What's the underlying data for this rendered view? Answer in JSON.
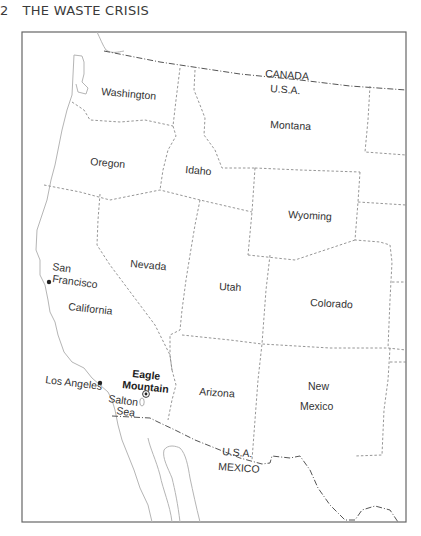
{
  "header": {
    "page_number": "2",
    "title": "THE WASTE CRISIS"
  },
  "map": {
    "countries": {
      "canada": "CANADA",
      "usa_north": "U.S.A.",
      "usa_south": "U.S.A.",
      "mexico": "MEXICO"
    },
    "states": {
      "washington": "Washington",
      "oregon": "Oregon",
      "idaho": "Idaho",
      "montana": "Montana",
      "wyoming": "Wyoming",
      "nevada": "Nevada",
      "california": "California",
      "utah": "Utah",
      "colorado": "Colorado",
      "arizona": "Arizona",
      "new_mexico_line1": "New",
      "new_mexico_line2": "Mexico"
    },
    "places": {
      "san_francisco_line1": "San",
      "san_francisco_line2": "Francisco",
      "los_angeles": "Los Angeles",
      "salton_sea_line1": "Salton",
      "salton_sea_line2": "Sea",
      "eagle_mountain_line1": "Eagle",
      "eagle_mountain_line2": "Mountain"
    },
    "colors": {
      "frame": "#666666",
      "coast": "#b0b0b0",
      "state_border": "#8a8a8a",
      "national_border": "#555555",
      "text": "#333333"
    }
  }
}
